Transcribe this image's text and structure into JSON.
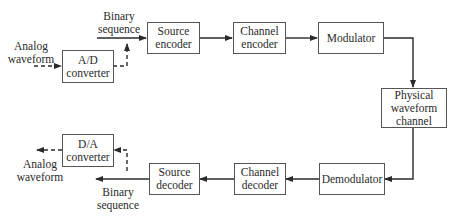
{
  "diagram": {
    "type": "block-diagram",
    "blocks": {
      "ad_converter": "A/D\nconverter",
      "source_encoder": "Source\nencoder",
      "channel_encoder": "Channel\nencoder",
      "modulator": "Modulator",
      "physical_channel": "Physical\nwaveform\nchannel",
      "demodulator": "Demodulator",
      "channel_decoder": "Channel\ndecoder",
      "source_decoder": "Source\ndecoder",
      "da_converter": "D/A\nconverter"
    },
    "labels": {
      "analog_in": "Analog\nwaveform",
      "binary_in": "Binary\nsequence",
      "analog_out": "Analog\nwaveform",
      "binary_out": "Binary\nsequence"
    },
    "edges": [
      {
        "from": "Analog waveform (input)",
        "to": "A/D converter",
        "style": "dashed"
      },
      {
        "from": "A/D converter",
        "to": "Binary sequence line",
        "style": "dashed"
      },
      {
        "from": "Binary sequence (input)",
        "to": "Source encoder",
        "style": "solid"
      },
      {
        "from": "Source encoder",
        "to": "Channel encoder",
        "style": "solid"
      },
      {
        "from": "Channel encoder",
        "to": "Modulator",
        "style": "solid"
      },
      {
        "from": "Modulator",
        "to": "Physical waveform channel",
        "style": "solid"
      },
      {
        "from": "Physical waveform channel",
        "to": "Demodulator",
        "style": "solid"
      },
      {
        "from": "Demodulator",
        "to": "Channel decoder",
        "style": "solid"
      },
      {
        "from": "Channel decoder",
        "to": "Source decoder",
        "style": "solid"
      },
      {
        "from": "Source decoder",
        "to": "Binary sequence (output)",
        "style": "solid"
      },
      {
        "from": "Binary sequence line",
        "to": "D/A converter",
        "style": "dashed"
      },
      {
        "from": "D/A converter",
        "to": "Analog waveform (output)",
        "style": "dashed"
      }
    ],
    "colors": {
      "line": "#2a2a2a",
      "box_border": "#555555",
      "background": "#ffffff"
    }
  }
}
